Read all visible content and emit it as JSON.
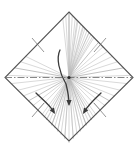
{
  "figure": {
    "title": "",
    "width": 138,
    "height": 150,
    "background_color": "#ffffff"
  },
  "colors": {
    "outline": "#555555",
    "ray": "#b9b9b9",
    "ray_dark": "#8d8d8d",
    "axis": "#6a6a6a",
    "arrow": "#3a3a3a",
    "tick": "#6a6a6a"
  },
  "geometry": {
    "center": {
      "x": 69,
      "y": 77.5
    },
    "diamond_vertices": [
      {
        "name": "top",
        "x": 69,
        "y": 12
      },
      {
        "name": "right",
        "x": 133,
        "y": 77.5
      },
      {
        "name": "bottom",
        "x": 69,
        "y": 141
      },
      {
        "name": "left",
        "x": 5,
        "y": 77.5
      }
    ],
    "outline_stroke_width": 1.1,
    "ray_stroke_width": 0.55,
    "axis_stroke_width": 0.8,
    "arrow_stroke_width": 1.3
  },
  "axis_line": {
    "name": "horizontal-centerline",
    "style": "dash-dot",
    "dash_pattern": "7 2 1.5 2",
    "from": {
      "x": 5,
      "y": 77.5
    },
    "to": {
      "x": 133,
      "y": 77.5
    }
  },
  "rays": {
    "description": "Thin straight lines radiating from the central point to the diamond boundary",
    "count": 38,
    "angles_deg": [
      -90,
      -82,
      -74,
      -66,
      -58,
      -50,
      -42,
      -34,
      -26,
      -18,
      -10,
      -2,
      6,
      14,
      22,
      30,
      38,
      46,
      54,
      62,
      70,
      78,
      86,
      94,
      102,
      110,
      118,
      126,
      134,
      142,
      150,
      158,
      166,
      174,
      182,
      190,
      198,
      206
    ]
  },
  "arrows": [
    {
      "name": "main-down-arrow",
      "label": "",
      "path": "M 60 50 C 56 58, 59 72, 66 84 C 68 92, 69 98, 69 104",
      "head_at": {
        "x": 69,
        "y": 106
      },
      "head_angle_deg": 90
    },
    {
      "name": "lower-left-arrow",
      "label": "",
      "path": "M 36 93 C 42 99, 49 104, 54 112",
      "head_at": {
        "x": 55,
        "y": 114
      },
      "head_angle_deg": 58
    },
    {
      "name": "lower-right-arrow",
      "label": "",
      "path": "M 101 93 C 95 99, 89 104, 84 112",
      "head_at": {
        "x": 83,
        "y": 114
      },
      "head_angle_deg": 122
    }
  ],
  "tick_marks": [
    {
      "name": "upper-left-edge-tick",
      "path": "M 32 38 L 44 52"
    },
    {
      "name": "upper-right-edge-tick",
      "path": "M 106 38 L 94 52"
    },
    {
      "name": "lower-left-edge-tick",
      "path": "M 32 117 L 44 103"
    },
    {
      "name": "lower-right-edge-tick",
      "path": "M 106 117 L 94 103"
    }
  ],
  "chart_data": {
    "type": "diagram",
    "title": "",
    "xlabel": "",
    "ylabel": ""
  }
}
